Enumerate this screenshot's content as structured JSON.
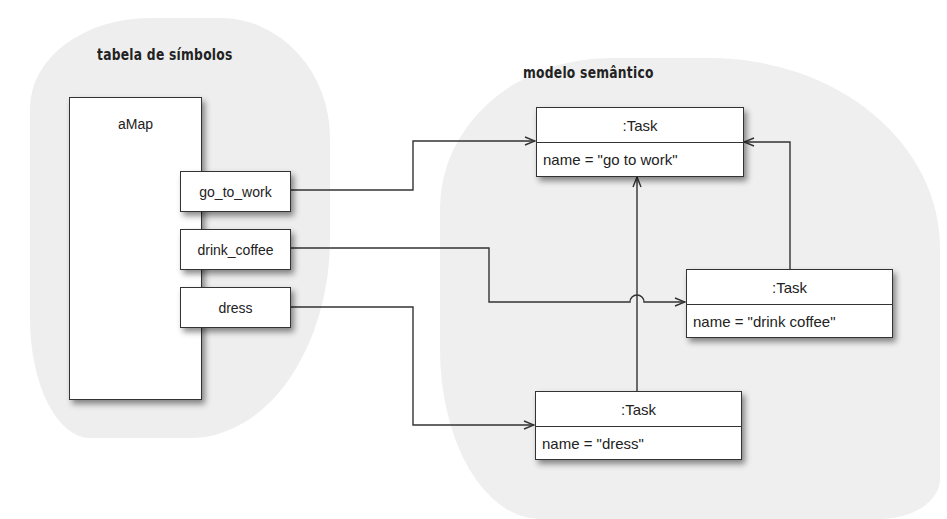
{
  "regions": {
    "symbol_table": {
      "title": "tabela de símbolos"
    },
    "semantic_model": {
      "title": "modelo semântico"
    }
  },
  "symbol_table": {
    "map_name": "aMap",
    "entries": [
      {
        "key": "go_to_work"
      },
      {
        "key": "drink_coffee"
      },
      {
        "key": "dress"
      }
    ]
  },
  "semantic_model": {
    "tasks": [
      {
        "type": ":Task",
        "attribute": "name = \"go to work\""
      },
      {
        "type": ":Task",
        "attribute": "name = \"drink coffee\""
      },
      {
        "type": ":Task",
        "attribute": "name = \"dress\""
      }
    ]
  },
  "connections": [
    {
      "from": "go_to_work",
      "to": "task:go to work"
    },
    {
      "from": "drink_coffee",
      "to": "task:drink coffee"
    },
    {
      "from": "dress",
      "to": "task:dress"
    },
    {
      "from": "task:dress",
      "to": "task:go to work"
    },
    {
      "from": "task:drink coffee",
      "to": "task:go to work"
    }
  ],
  "colors": {
    "line": "#333333",
    "background_blob": "#eeeeee",
    "box_fill": "#ffffff"
  }
}
